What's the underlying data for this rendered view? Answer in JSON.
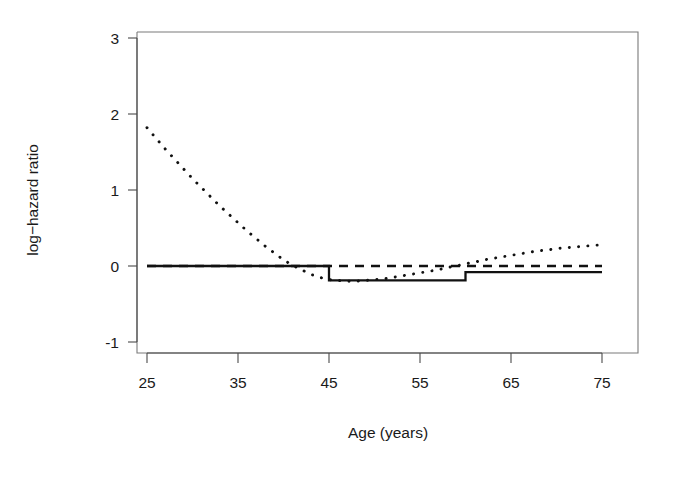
{
  "chart_data": {
    "type": "line",
    "title": "",
    "xlabel": "Age (years)",
    "ylabel": "log−hazard ratio",
    "xlim": [
      24,
      74
    ],
    "ylim": [
      -1.45,
      3.25
    ],
    "xticks": [
      25,
      35,
      45,
      55,
      65,
      75
    ],
    "xtick_labels": [
      "25",
      "35",
      "45",
      "55",
      "65",
      "75"
    ],
    "yticks": [
      -1,
      0,
      1,
      2,
      3
    ],
    "ytick_labels": [
      "-1",
      "0",
      "1",
      "2",
      "3"
    ],
    "grid": false,
    "legend": "none",
    "box": true,
    "series": [
      {
        "name": "step-solid",
        "style": "solid",
        "color": "#111111",
        "shape": "step",
        "x": [
          25,
          45,
          45,
          60,
          60,
          75
        ],
        "y": [
          0.0,
          0.0,
          -0.19,
          -0.19,
          -0.08,
          -0.08
        ]
      },
      {
        "name": "smooth-dotted",
        "style": "dotted",
        "color": "#111111",
        "shape": "smooth",
        "x": [
          25,
          26,
          27,
          28,
          29,
          30,
          31,
          32,
          33,
          34,
          35,
          36,
          37,
          38,
          39,
          40,
          41,
          42,
          43,
          44,
          45,
          46,
          47,
          48,
          49,
          50,
          51,
          52,
          53,
          54,
          55,
          56,
          57,
          58,
          59,
          60,
          61,
          62,
          63,
          64,
          65,
          66,
          67,
          68,
          69,
          70,
          71,
          72,
          73,
          74,
          75
        ],
        "y": [
          1.82,
          1.68,
          1.54,
          1.41,
          1.28,
          1.15,
          1.03,
          0.91,
          0.79,
          0.68,
          0.57,
          0.46,
          0.36,
          0.26,
          0.17,
          0.08,
          0.01,
          -0.05,
          -0.11,
          -0.15,
          -0.18,
          -0.19,
          -0.2,
          -0.2,
          -0.19,
          -0.18,
          -0.17,
          -0.15,
          -0.13,
          -0.11,
          -0.09,
          -0.07,
          -0.05,
          -0.02,
          0.0,
          0.03,
          0.05,
          0.08,
          0.1,
          0.12,
          0.14,
          0.16,
          0.18,
          0.2,
          0.21,
          0.23,
          0.24,
          0.25,
          0.26,
          0.27,
          0.28
        ]
      },
      {
        "name": "smooth-dashed",
        "style": "dashed",
        "color": "#111111",
        "shape": "smooth",
        "x": [
          25,
          30,
          35,
          40,
          45,
          50,
          55,
          60,
          65,
          70,
          75
        ],
        "y": [
          0.0,
          0.0,
          0.0,
          0.0,
          0.0,
          0.0,
          0.0,
          0.0,
          0.0,
          0.0,
          0.0
        ]
      }
    ]
  },
  "labels": {
    "y_axis_title": "log−hazard ratio",
    "x_axis_title": "Age (years)"
  },
  "ticks": {
    "x": [
      "25",
      "35",
      "45",
      "55",
      "65",
      "75"
    ],
    "y": [
      "3",
      "2",
      "1",
      "0",
      "-1"
    ]
  },
  "colors": {
    "foreground": "#111111",
    "axis": "#4a4a4a",
    "background": "#ffffff"
  }
}
